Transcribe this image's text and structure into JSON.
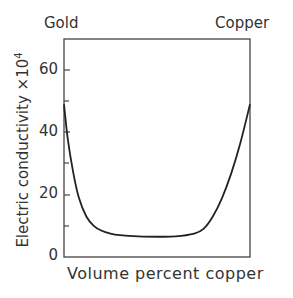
{
  "chart_data": {
    "type": "line",
    "title": "",
    "xlabel": "Volume percent copper",
    "ylabel": "Electric conductivity ×10⁴",
    "xlim": [
      0,
      100
    ],
    "ylim": [
      0,
      70
    ],
    "y_ticks": [
      0,
      20,
      40,
      60
    ],
    "y_minor_ticks": [
      10,
      30,
      50
    ],
    "annotations": {
      "left": "Gold",
      "right": "Copper"
    },
    "grid": false,
    "series": [
      {
        "name": "conductivity",
        "x": [
          0,
          2,
          5,
          8,
          12,
          16,
          20,
          25,
          30,
          40,
          50,
          60,
          70,
          75,
          80,
          85,
          90,
          95,
          100
        ],
        "values": [
          49,
          38,
          27,
          19,
          13,
          10,
          8.5,
          7.5,
          7,
          6.6,
          6.5,
          6.6,
          7.5,
          9,
          13,
          19,
          27,
          37,
          49
        ]
      }
    ]
  },
  "labels": {
    "gold": "Gold",
    "copper": "Copper",
    "xlabel": "Volume percent copper",
    "ylabel": "Electric conductivity ×10",
    "ylabel_exp": "4",
    "ticks": [
      "60",
      "40",
      "20",
      "0"
    ]
  }
}
